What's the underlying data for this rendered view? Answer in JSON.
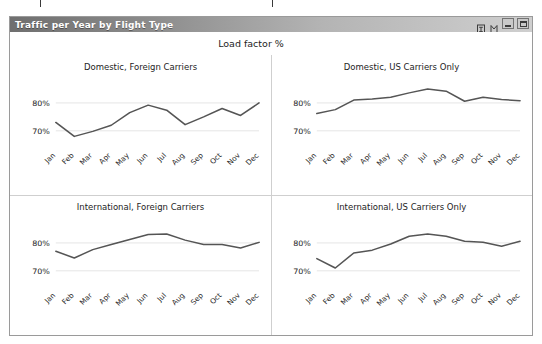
{
  "window": {
    "title": "Traffic per Year by Flight Type",
    "controls": [
      {
        "name": "help-icon",
        "label": "?"
      },
      {
        "name": "restore-icon",
        "label": "❐"
      },
      {
        "name": "minimize-button",
        "label": "–"
      },
      {
        "name": "maximize-button",
        "label": "□"
      }
    ]
  },
  "chart_data": {
    "type": "line",
    "title": "Load factor %",
    "xlabel": "",
    "ylabel": "",
    "ylim": [
      64,
      88
    ],
    "yticks": [
      70,
      80
    ],
    "ytick_labels": [
      "70%",
      "80%"
    ],
    "grid": true,
    "legend": "none",
    "categories": [
      "Jan",
      "Feb",
      "Mar",
      "Apr",
      "May",
      "Jun",
      "Jul",
      "Aug",
      "Sep",
      "Oct",
      "Nov",
      "Dec"
    ],
    "line_color": "#555555",
    "panels": [
      {
        "title": "Domestic, Foreign Carriers",
        "values": [
          73.0,
          68.0,
          69.8,
          72.0,
          76.5,
          79.2,
          77.4,
          72.2,
          75.0,
          78.0,
          75.5,
          80.0
        ]
      },
      {
        "title": "Domestic, US Carriers Only",
        "values": [
          76.2,
          77.6,
          81.0,
          81.4,
          82.0,
          83.6,
          85.0,
          84.2,
          80.6,
          82.0,
          81.2,
          80.8
        ]
      },
      {
        "title": "International, Foreign Carriers",
        "values": [
          77.0,
          74.6,
          77.6,
          79.4,
          81.2,
          83.0,
          83.2,
          81.0,
          79.4,
          79.4,
          78.2,
          80.2
        ]
      },
      {
        "title": "International, US Carriers Only",
        "values": [
          74.4,
          71.0,
          76.4,
          77.4,
          79.6,
          82.4,
          83.2,
          82.4,
          80.6,
          80.2,
          78.8,
          80.6
        ]
      }
    ]
  }
}
